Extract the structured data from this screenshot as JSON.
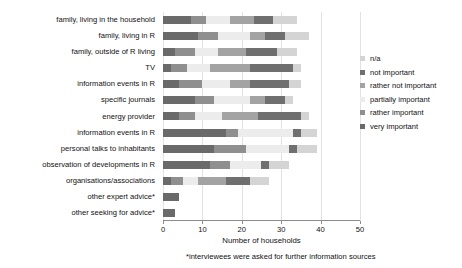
{
  "chart_data": {
    "type": "bar",
    "orientation": "horizontal",
    "stacked": true,
    "title": "",
    "xlabel": "Number of households",
    "ylabel": "",
    "xlim": [
      0,
      50
    ],
    "xticks": [
      0,
      10,
      20,
      30,
      40,
      50
    ],
    "xticklabels": [
      "0",
      "10",
      "20",
      "30",
      "40",
      "50"
    ],
    "grid": true,
    "legend_position": "right",
    "footnote": "*interviewees were asked for further information sources",
    "categories": [
      "family, living in the household",
      "family, living in R",
      "family, outside of R living",
      "TV",
      "information events in R",
      "specific journals",
      "energy provider",
      "information events in R",
      "personal talks to inhabitants",
      "observation of developments in R",
      "organisations/associations",
      "other expert advice*",
      "other seeking for advice*"
    ],
    "series": [
      {
        "name": "very important",
        "color": "#6a6a6a",
        "values": [
          7,
          9,
          3,
          2,
          4,
          8,
          4,
          16,
          13,
          12,
          2,
          4,
          3
        ]
      },
      {
        "name": "rather important",
        "color": "#8f8f8f",
        "values": [
          4,
          5,
          5,
          4,
          6,
          5,
          4,
          3,
          8,
          5,
          3,
          0,
          0
        ]
      },
      {
        "name": "partially important",
        "color": "#ececec",
        "values": [
          6,
          8,
          6,
          6,
          7,
          9,
          7,
          14,
          11,
          8,
          4,
          0,
          0
        ]
      },
      {
        "name": "rather not important",
        "color": "#a3a3a3",
        "values": [
          6,
          4,
          7,
          10,
          5,
          4,
          9,
          0,
          0,
          0,
          7,
          0,
          0
        ]
      },
      {
        "name": "not important",
        "color": "#6f6f6f",
        "values": [
          5,
          5,
          8,
          11,
          10,
          5,
          11,
          2,
          2,
          2,
          6,
          0,
          0
        ]
      },
      {
        "name": "n/a",
        "color": "#d4d4d4",
        "values": [
          6,
          6,
          5,
          2,
          3,
          2,
          2,
          4,
          5,
          5,
          5,
          0,
          0
        ]
      }
    ]
  },
  "legend": {
    "items": [
      {
        "label": "n/a",
        "color": "#d4d4d4"
      },
      {
        "label": "not important",
        "color": "#6f6f6f"
      },
      {
        "label": "rather not important",
        "color": "#a3a3a3"
      },
      {
        "label": "partially important",
        "color": "#ececec"
      },
      {
        "label": "rather important",
        "color": "#8f8f8f"
      },
      {
        "label": "very important",
        "color": "#6a6a6a"
      }
    ]
  },
  "axis": {
    "x_title": "Number of households",
    "footnote": "*interviewees were asked for further information sources"
  }
}
